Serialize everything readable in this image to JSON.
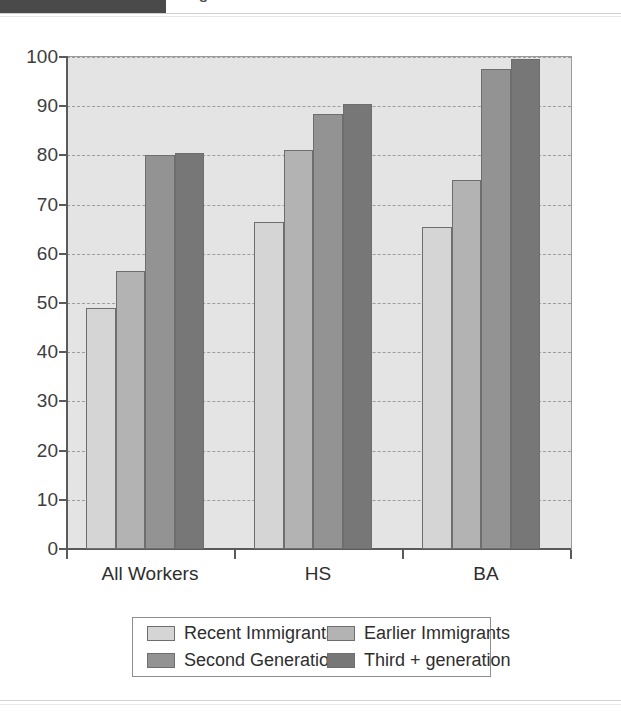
{
  "header": {
    "title": "Wage Differential of Mexican Female Relative to",
    "block_color": "#4a4a4a"
  },
  "chart_data": {
    "type": "bar",
    "title": "Wage Differential of Mexican Female Relative to",
    "xlabel": "",
    "ylabel": "",
    "ylim": [
      0,
      100
    ],
    "ytick_step": 10,
    "grid": true,
    "grid_style": "dashed-horizontal",
    "legend_position": "bottom",
    "plot_background": "#e4e4e4",
    "categories": [
      "All Workers",
      "HS",
      "BA"
    ],
    "ytick_labels": [
      "100",
      "90",
      "80",
      "70",
      "60",
      "50",
      "40",
      "30",
      "20",
      "10",
      "0"
    ],
    "series": [
      {
        "name": "Recent Immigrants",
        "color": "#d5d5d5",
        "values": [
          49.0,
          66.5,
          65.5
        ]
      },
      {
        "name": "Earlier Immigrants",
        "color": "#b3b3b3",
        "values": [
          56.5,
          81.0,
          75.0
        ]
      },
      {
        "name": "Second Generation",
        "color": "#939393",
        "values": [
          80.0,
          88.5,
          97.5
        ]
      },
      {
        "name": "Third + generation",
        "color": "#777777",
        "values": [
          80.5,
          90.5,
          99.5
        ]
      }
    ]
  }
}
